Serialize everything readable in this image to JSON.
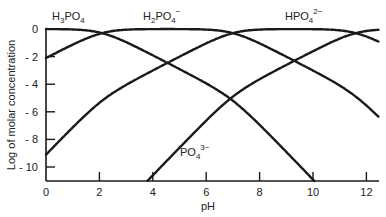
{
  "chart_data": {
    "type": "line",
    "title": "",
    "xlabel": "pH",
    "ylabel": "Log of molar concentration",
    "xlim": [
      0,
      12.5
    ],
    "ylim": [
      -11,
      0.3
    ],
    "x_ticks": [
      0,
      2,
      4,
      6,
      8,
      10,
      12
    ],
    "y_ticks": [
      0,
      -2,
      -4,
      -6,
      -8,
      -10
    ],
    "x_tick_labels": [
      "0",
      "2",
      "4",
      "6",
      "8",
      "10",
      "12"
    ],
    "y_tick_labels": [
      "0",
      "- 2",
      "- 4",
      "- 6",
      "- 8",
      "- 10"
    ],
    "grid": false,
    "legend": "inline species labels",
    "pKa": [
      2.1,
      7.0,
      11.6
    ],
    "series": [
      {
        "name": "H3PO4",
        "label_main": "H",
        "label_parts": [
          "H",
          "3",
          "PO",
          "4",
          ""
        ],
        "points": [
          [
            0,
            -0.01
          ],
          [
            2.1,
            -0.3
          ],
          [
            4.5,
            -2.5
          ],
          [
            6.9,
            -5.1
          ],
          [
            9.9,
            -11
          ]
        ]
      },
      {
        "name": "H2PO4-",
        "label_parts": [
          "H",
          "2",
          "PO",
          "4",
          "−"
        ],
        "points": [
          [
            0,
            -2.1
          ],
          [
            2.1,
            -0.3
          ],
          [
            4.6,
            0
          ],
          [
            7.0,
            -0.3
          ],
          [
            9.3,
            -2.5
          ],
          [
            12.5,
            -5.5
          ]
        ]
      },
      {
        "name": "HPO4 2-",
        "label_parts": [
          "HPO",
          "4",
          "",
          "",
          "2−"
        ],
        "points": [
          [
            0,
            -9.1
          ],
          [
            4.5,
            -2.5
          ],
          [
            7.0,
            -0.3
          ],
          [
            9.3,
            0
          ],
          [
            11.6,
            -0.3
          ],
          [
            12.5,
            -0.95
          ]
        ]
      },
      {
        "name": "PO4 3-",
        "label_parts": [
          "PO",
          "4",
          "",
          "",
          "3−"
        ],
        "points": [
          [
            3.7,
            -11
          ],
          [
            6.9,
            -5.1
          ],
          [
            9.3,
            -2.5
          ],
          [
            11.6,
            -0.3
          ],
          [
            12.5,
            -0.05
          ]
        ]
      }
    ],
    "crossings": [
      {
        "pH": 2.1,
        "log": -0.3,
        "between": [
          "H3PO4",
          "H2PO4-"
        ]
      },
      {
        "pH": 7.0,
        "log": -0.3,
        "between": [
          "H2PO4-",
          "HPO4 2-"
        ]
      },
      {
        "pH": 11.6,
        "log": -0.3,
        "between": [
          "HPO4 2-",
          "PO4 3-"
        ]
      },
      {
        "pH": 4.5,
        "log": -2.5,
        "between": [
          "H3PO4",
          "HPO4 2-"
        ]
      },
      {
        "pH": 6.9,
        "log": -5.1,
        "between": [
          "H3PO4",
          "PO4 3-"
        ]
      },
      {
        "pH": 9.3,
        "log": -2.5,
        "between": [
          "H2PO4-",
          "PO4 3-"
        ]
      }
    ]
  },
  "labels": {
    "xlabel": "pH",
    "ylabel": "Log of molar concentration",
    "species": {
      "h3po4": {
        "a": "H",
        "b": "3",
        "c": "PO",
        "d": "4",
        "e": ""
      },
      "h2po4": {
        "a": "H",
        "b": "2",
        "c": "PO",
        "d": "4",
        "e": "−"
      },
      "hpo4": {
        "a": "HPO",
        "b": "4",
        "e": "2−"
      },
      "po4": {
        "a": "PO",
        "b": "4",
        "e": "3−"
      }
    },
    "x_ticks": [
      "0",
      "2",
      "4",
      "6",
      "8",
      "10",
      "12"
    ],
    "y_ticks": [
      "0",
      "- 2",
      "- 4",
      "- 6",
      "- 8",
      "- 10"
    ]
  }
}
